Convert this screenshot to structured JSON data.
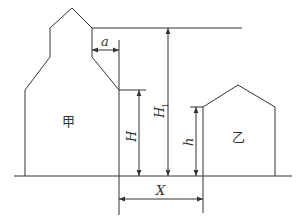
{
  "diagram": {
    "type": "building-spacing-diagram",
    "buildings": {
      "left": {
        "label": "甲"
      },
      "right": {
        "label": "乙"
      }
    },
    "dimensions": {
      "a": {
        "label": "a"
      },
      "H": {
        "label": "H"
      },
      "H1": {
        "label": "H",
        "subscript": "1"
      },
      "h": {
        "label": "h"
      },
      "X": {
        "label": "X"
      }
    },
    "colors": {
      "line": "#333333",
      "background": "#ffffff"
    }
  }
}
